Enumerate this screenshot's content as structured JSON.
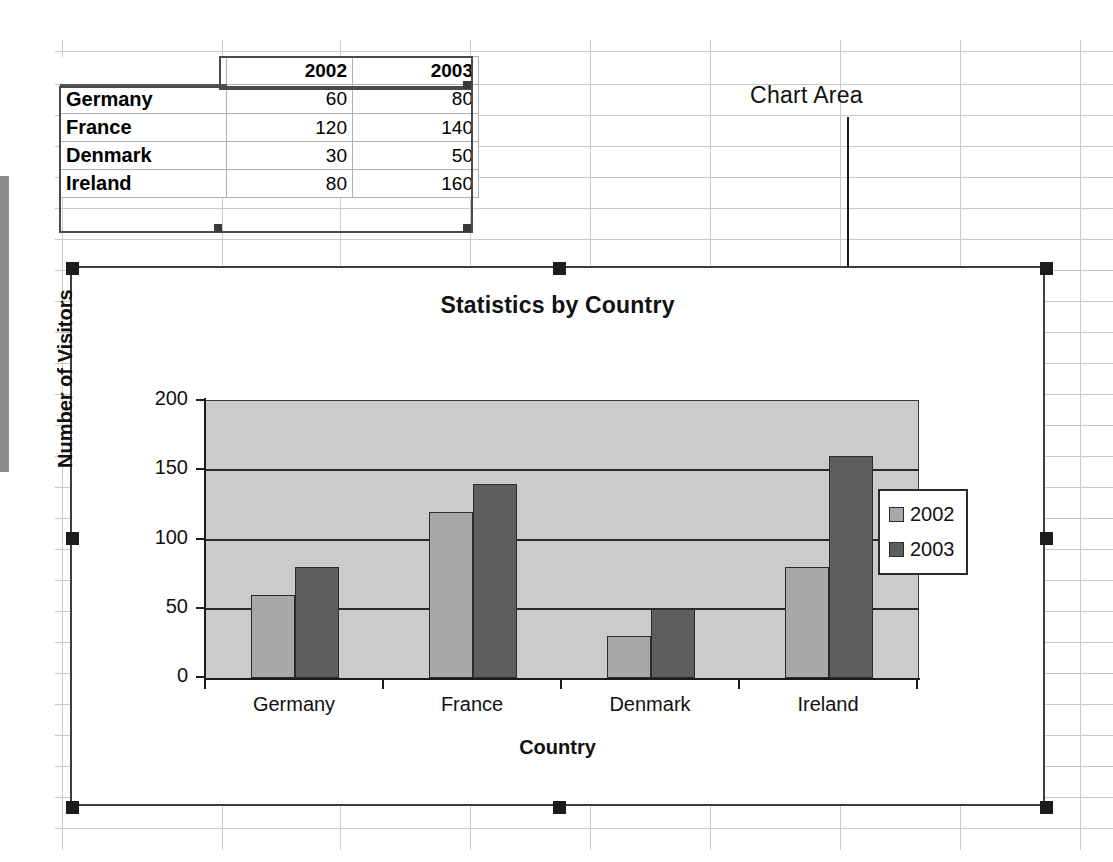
{
  "worksheet": {
    "columns": [
      "",
      "2002",
      "2003"
    ],
    "rows": [
      {
        "label": "Germany",
        "v2002": "60",
        "v2003": "80"
      },
      {
        "label": "France",
        "v2002": "120",
        "v2003": "140"
      },
      {
        "label": "Denmark",
        "v2002": "30",
        "v2003": "50"
      },
      {
        "label": "Ireland",
        "v2002": "80",
        "v2003": "160"
      }
    ]
  },
  "annotation": {
    "label": "Chart Area"
  },
  "chart_data": {
    "type": "bar",
    "title": "Statistics by Country",
    "xlabel": "Country",
    "ylabel": "Number of Visitors",
    "categories": [
      "Germany",
      "France",
      "Denmark",
      "Ireland"
    ],
    "series": [
      {
        "name": "2002",
        "values": [
          60,
          120,
          30,
          80
        ],
        "color": "#a8a8a8"
      },
      {
        "name": "2003",
        "values": [
          80,
          140,
          50,
          160
        ],
        "color": "#5e5e5e"
      }
    ],
    "ylim": [
      0,
      200
    ],
    "yticks": [
      "0",
      "50",
      "100",
      "150",
      "200"
    ],
    "grid": true,
    "legend_position": "right",
    "plot_background": "#cbcbcb"
  }
}
